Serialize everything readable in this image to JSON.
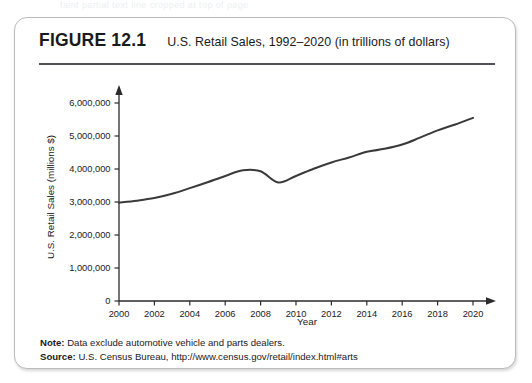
{
  "ghost_text": "faint partial text line cropped at top of page",
  "figure": {
    "number": "FIGURE 12.1",
    "title": "U.S. Retail Sales, 1992–2020 (in trillions of dollars)"
  },
  "footer": {
    "note_label": "Note:",
    "note_text": " Data exclude automotive vehicle and parts dealers.",
    "source_label": "Source:",
    "source_text": " U.S. Census Bureau, http://www.census.gov/retail/index.html#arts"
  },
  "chart_data": {
    "type": "line",
    "title": "U.S. Retail Sales, 1992–2020 (in trillions of dollars)",
    "xlabel": "Year",
    "ylabel": "U.S. Retail Sales (millions $)",
    "xlim": [
      2000,
      2020
    ],
    "ylim": [
      0,
      6000000
    ],
    "grid": false,
    "legend": "none",
    "xticks": [
      2000,
      2002,
      2004,
      2006,
      2008,
      2010,
      2012,
      2014,
      2016,
      2018,
      2020
    ],
    "xtick_labels": [
      "2000",
      "2002",
      "2004",
      "2006",
      "2008",
      "2010",
      "2012",
      "2014",
      "2016",
      "2018",
      "2020"
    ],
    "yticks": [
      0,
      1000000,
      2000000,
      3000000,
      4000000,
      5000000,
      6000000
    ],
    "ytick_labels": [
      "0",
      "1,000,000",
      "2,000,000",
      "3,000,000",
      "4,000,000",
      "5,000,000",
      "6,000,000"
    ],
    "x": [
      2000,
      2001,
      2002,
      2003,
      2004,
      2005,
      2006,
      2007,
      2008,
      2009,
      2010,
      2011,
      2012,
      2013,
      2014,
      2015,
      2016,
      2017,
      2018,
      2019,
      2020
    ],
    "values": [
      2980000,
      3040000,
      3120000,
      3250000,
      3420000,
      3600000,
      3790000,
      3960000,
      3930000,
      3590000,
      3790000,
      4010000,
      4200000,
      4350000,
      4520000,
      4610000,
      4740000,
      4950000,
      5170000,
      5350000,
      5550000
    ],
    "series_name": "U.S. Retail Sales",
    "line_color": "#3a3a3a",
    "annotations": []
  }
}
